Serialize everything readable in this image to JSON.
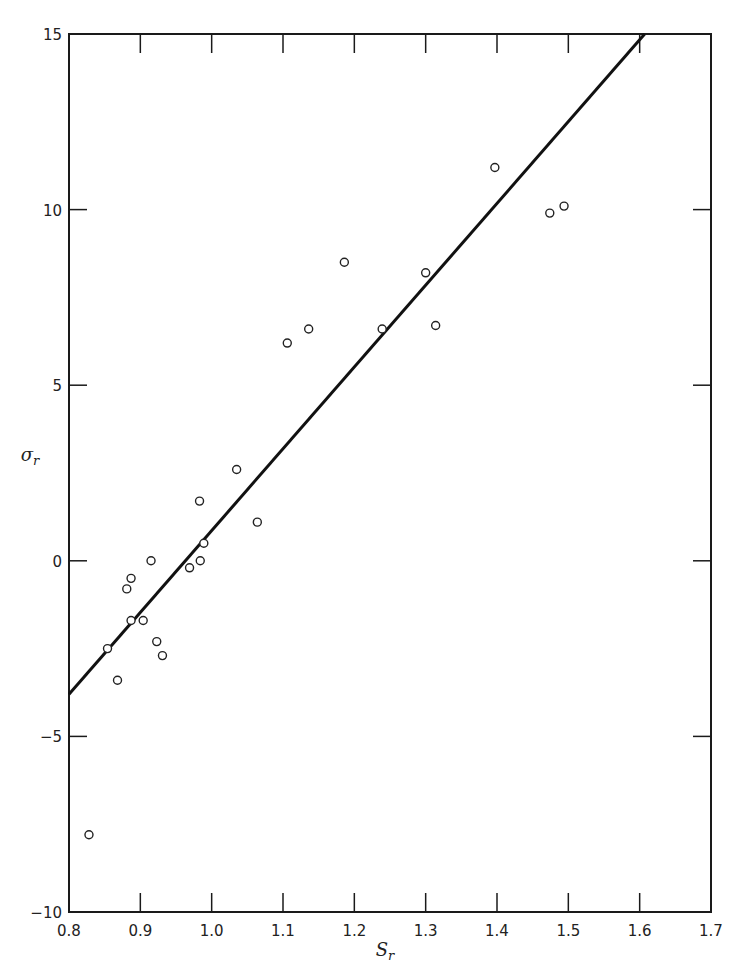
{
  "chart_data": {
    "type": "scatter",
    "title": "",
    "xlabel": "S_r",
    "ylabel": "σ_r",
    "xlim": [
      0.8,
      1.7
    ],
    "ylim": [
      -10,
      15
    ],
    "grid": false,
    "legend": null,
    "x_ticks": [
      "0.8",
      "0.9",
      "1.0",
      "1.1",
      "1.2",
      "1.3",
      "1.4",
      "1.5",
      "1.6",
      "1.7"
    ],
    "y_ticks": [
      "−10",
      "−5",
      "0",
      "5",
      "10",
      "15"
    ],
    "series": [
      {
        "name": "data",
        "marker": "open-circle",
        "points": [
          {
            "x": 0.828,
            "y": -7.8
          },
          {
            "x": 0.854,
            "y": -2.5
          },
          {
            "x": 0.868,
            "y": -3.4
          },
          {
            "x": 0.881,
            "y": -0.8
          },
          {
            "x": 0.887,
            "y": -0.5
          },
          {
            "x": 0.887,
            "y": -1.7
          },
          {
            "x": 0.904,
            "y": -1.7
          },
          {
            "x": 0.915,
            "y": 0.0
          },
          {
            "x": 0.923,
            "y": -2.3
          },
          {
            "x": 0.931,
            "y": -2.7
          },
          {
            "x": 0.969,
            "y": -0.2
          },
          {
            "x": 0.983,
            "y": 1.7
          },
          {
            "x": 0.984,
            "y": 0.0
          },
          {
            "x": 0.989,
            "y": 0.5
          },
          {
            "x": 1.035,
            "y": 2.6
          },
          {
            "x": 1.064,
            "y": 1.1
          },
          {
            "x": 1.106,
            "y": 6.2
          },
          {
            "x": 1.136,
            "y": 6.6
          },
          {
            "x": 1.186,
            "y": 8.5
          },
          {
            "x": 1.239,
            "y": 6.6
          },
          {
            "x": 1.3,
            "y": 8.2
          },
          {
            "x": 1.314,
            "y": 6.7
          },
          {
            "x": 1.397,
            "y": 11.2
          },
          {
            "x": 1.474,
            "y": 9.9
          },
          {
            "x": 1.494,
            "y": 10.1
          }
        ]
      },
      {
        "name": "fit",
        "type": "line",
        "points": [
          {
            "x": 0.8,
            "y": -3.8
          },
          {
            "x": 1.607,
            "y": 15.0
          }
        ]
      }
    ]
  }
}
